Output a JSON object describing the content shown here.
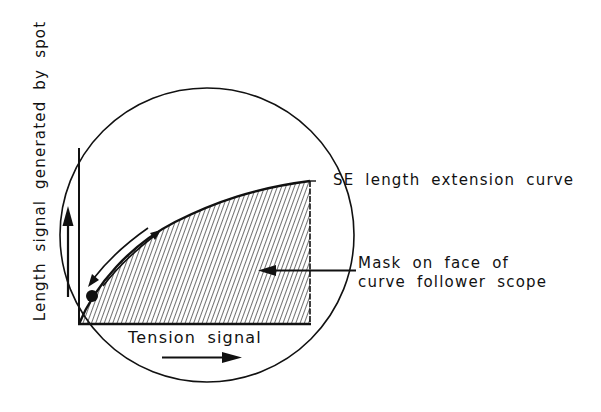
{
  "diagram": {
    "y_axis_label": "Length signal generated by spot",
    "x_axis_label": "Tension signal",
    "curve_label": "SE length extension curve",
    "mask_label": {
      "line1": "Mask on face of",
      "line2": "curve follower scope"
    },
    "colors": {
      "ink": "#111111",
      "background": "#ffffff",
      "hatch": "#222222"
    },
    "elements": {
      "scope_face": "circle",
      "spot": "filled-dot",
      "mask": "hatched-region-under-curve",
      "arrows": [
        "length-up-arrow",
        "tension-right-arrow",
        "spot-travel-down-arrow",
        "spot-travel-up-arrow",
        "mask-pointer-arrow"
      ]
    }
  }
}
